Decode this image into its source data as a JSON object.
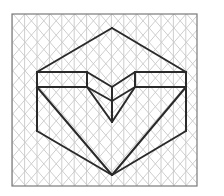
{
  "figure": {
    "type": "isometric-drawing",
    "colors": {
      "background": "#ffffff",
      "grid": "#c8c8c8",
      "frame": "#7a7a7a",
      "outline": "#2a2a2a"
    },
    "frame": {
      "x": 12,
      "y": 14,
      "width": 185,
      "height": 172
    },
    "grid": {
      "vertical_spacing": 12.4,
      "row_spacing": 14.3
    },
    "outline_segments": [
      [
        37,
        72,
        112,
        28
      ],
      [
        112,
        28,
        186,
        72
      ],
      [
        37,
        72,
        87,
        72
      ],
      [
        37,
        87,
        87,
        87
      ],
      [
        87,
        72,
        87,
        87
      ],
      [
        135,
        72,
        186,
        72
      ],
      [
        135,
        87,
        186,
        87
      ],
      [
        135,
        72,
        135,
        87
      ],
      [
        87,
        72,
        112,
        87
      ],
      [
        112,
        87,
        135,
        72
      ],
      [
        87,
        87,
        112,
        101
      ],
      [
        112,
        101,
        135,
        87
      ],
      [
        112,
        87,
        112,
        122
      ],
      [
        87,
        87,
        112,
        122
      ],
      [
        135,
        87,
        112,
        122
      ],
      [
        37,
        72,
        37,
        131
      ],
      [
        186,
        72,
        186,
        131
      ],
      [
        37,
        131,
        112,
        175
      ],
      [
        186,
        131,
        112,
        175
      ],
      [
        37,
        87,
        112,
        175
      ],
      [
        186,
        87,
        112,
        175
      ]
    ]
  }
}
